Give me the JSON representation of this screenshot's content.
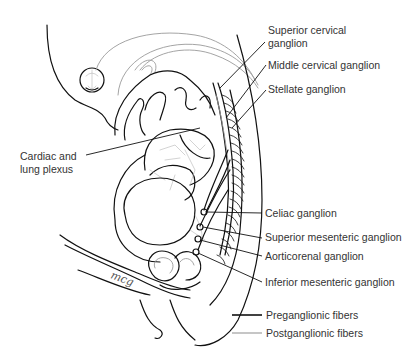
{
  "figure": {
    "signature": "mcg"
  },
  "labels": {
    "superior_cervical": "Superior cervical ganglion",
    "superior_cervical_line1": "Superior cervical",
    "superior_cervical_line2": "ganglion",
    "middle_cervical": "Middle cervical ganglion",
    "stellate": "Stellate ganglion",
    "cardiac_lung_line1": "Cardiac and",
    "cardiac_lung_line2": "lung plexus",
    "celiac": "Celiac ganglion",
    "superior_mesenteric": "Superior mesenteric ganglion",
    "aorticorenal": "Aorticorenal ganglion",
    "inferior_mesenteric": "Inferior mesenteric ganglion"
  },
  "legend": {
    "items": [
      {
        "label": "Preganglionic fibers",
        "color": "#111111",
        "style": "dark line"
      },
      {
        "label": "Postganglionic fibers",
        "color": "#a0a0a0",
        "style": "gray line"
      }
    ]
  }
}
